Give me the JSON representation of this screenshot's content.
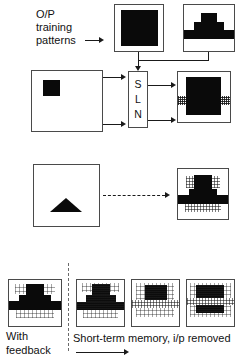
{
  "figure": {
    "title_label": "O/P training patterns",
    "labels": {
      "op_training_line1": "O/P",
      "op_training_line2": "training",
      "op_training_line3": "patterns",
      "with_feedback_line1": "With",
      "with_feedback_line2": "feedback",
      "short_term_memory": "Short-term memory, i/p removed",
      "sln_s": "S",
      "sln_l": "L",
      "sln_n": "N"
    },
    "network_box": {
      "name": "SLN",
      "letters": [
        "S",
        "L",
        "N"
      ]
    },
    "training_patterns": [
      {
        "id": "pattern-solid-square",
        "shape": "solid-square"
      },
      {
        "id": "pattern-stepped-pyramid",
        "shape": "stepped-pyramid"
      }
    ],
    "input_boxes": [
      {
        "id": "input-square",
        "shape": "small-solid-square"
      },
      {
        "id": "input-triangle",
        "shape": "solid-triangle"
      }
    ],
    "output_boxes": [
      {
        "id": "output-square-recall",
        "shape": "solid-square-with-noise-band"
      },
      {
        "id": "output-pyramid-recall",
        "shape": "stepped-pyramid-with-noise-band"
      }
    ],
    "memory_sequence": [
      {
        "id": "memory-frame-0",
        "caption_group": "with-feedback",
        "degradation": "none"
      },
      {
        "id": "memory-frame-1",
        "caption_group": "short-term-memory",
        "degradation": "slight"
      },
      {
        "id": "memory-frame-2",
        "caption_group": "short-term-memory",
        "degradation": "moderate"
      },
      {
        "id": "memory-frame-3",
        "caption_group": "short-term-memory",
        "degradation": "severe"
      }
    ],
    "colors": {
      "ink": "#0a0a0a",
      "frame": "#4a4a4a",
      "paper": "#ffffff",
      "divider": "#6a6a6a"
    }
  }
}
